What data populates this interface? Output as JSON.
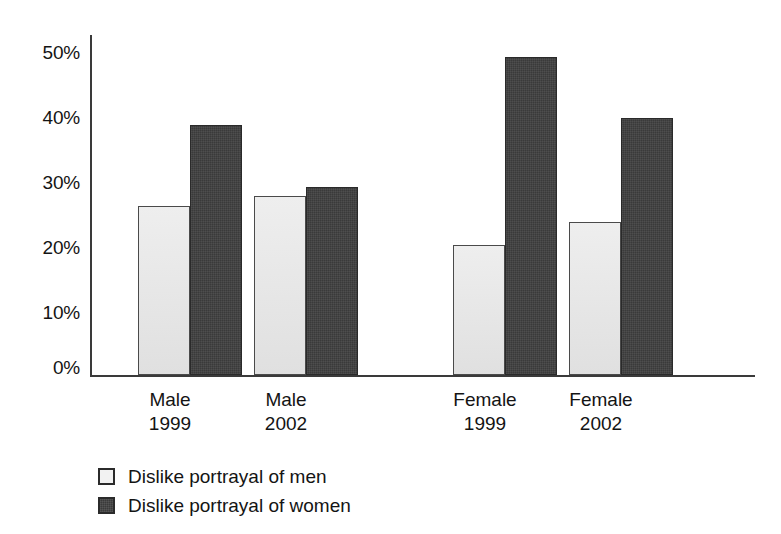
{
  "chart_data": {
    "type": "bar",
    "title": "",
    "subtitle": "",
    "xlabel": "",
    "ylabel": "",
    "ylim": [
      0,
      50
    ],
    "grid": false,
    "legend_position": "bottom-left",
    "y_ticks": [
      {
        "value": 50,
        "label": "50%"
      },
      {
        "value": 40,
        "label": "40%"
      },
      {
        "value": 30,
        "label": "30%"
      },
      {
        "value": 20,
        "label": "20%"
      },
      {
        "value": 10,
        "label": "10%"
      },
      {
        "value": 0,
        "label": "0%"
      }
    ],
    "categories": [
      {
        "line1": "Male",
        "line2": "1999"
      },
      {
        "line1": "Male",
        "line2": "2002"
      },
      {
        "line1": "Female",
        "line2": "1999"
      },
      {
        "line1": "Female",
        "line2": "2002"
      }
    ],
    "series": [
      {
        "name": "Dislike portrayal of men",
        "color": "#e3e3e3",
        "values": [
          26,
          27.5,
          20,
          23.5
        ]
      },
      {
        "name": "Dislike portrayal of women",
        "color": "#3a3a3a",
        "values": [
          38.5,
          29,
          49,
          39.5
        ]
      }
    ]
  },
  "legend": {
    "items": [
      {
        "label": "Dislike portrayal of men",
        "swatch": "light-square-icon"
      },
      {
        "label": "Dislike portrayal of women",
        "swatch": "dark-square-icon"
      }
    ]
  }
}
